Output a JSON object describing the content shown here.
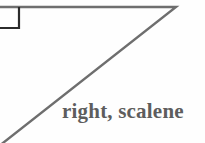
{
  "figure": {
    "background_color": "#fefefe",
    "label": "right, scalene",
    "label_color": "#5d5d5d",
    "stroke_color": "#6e6e6e",
    "right_angle_color": "#2b2b2b",
    "stroke_width": 2.4,
    "right_angle_marker": {
      "name": "right-angle-square",
      "x": 0,
      "y": 7,
      "width": 19,
      "height": 21
    },
    "triangle": {
      "type": "right scalene",
      "cropped_at_left_edge": true,
      "vertices": [
        {
          "name": "top-left-corner",
          "x": -6,
          "y": 7
        },
        {
          "name": "top-right-apex",
          "x": 176,
          "y": 7
        },
        {
          "name": "bottom-left",
          "x": -6,
          "y": 150
        }
      ],
      "edges": [
        {
          "name": "horizontal-leg",
          "from": "top-left-corner",
          "to": "top-right-apex"
        },
        {
          "name": "hypotenuse",
          "from": "top-right-apex",
          "to": "bottom-left"
        },
        {
          "name": "vertical-leg",
          "from": "bottom-left",
          "to": "top-left-corner"
        }
      ]
    }
  }
}
